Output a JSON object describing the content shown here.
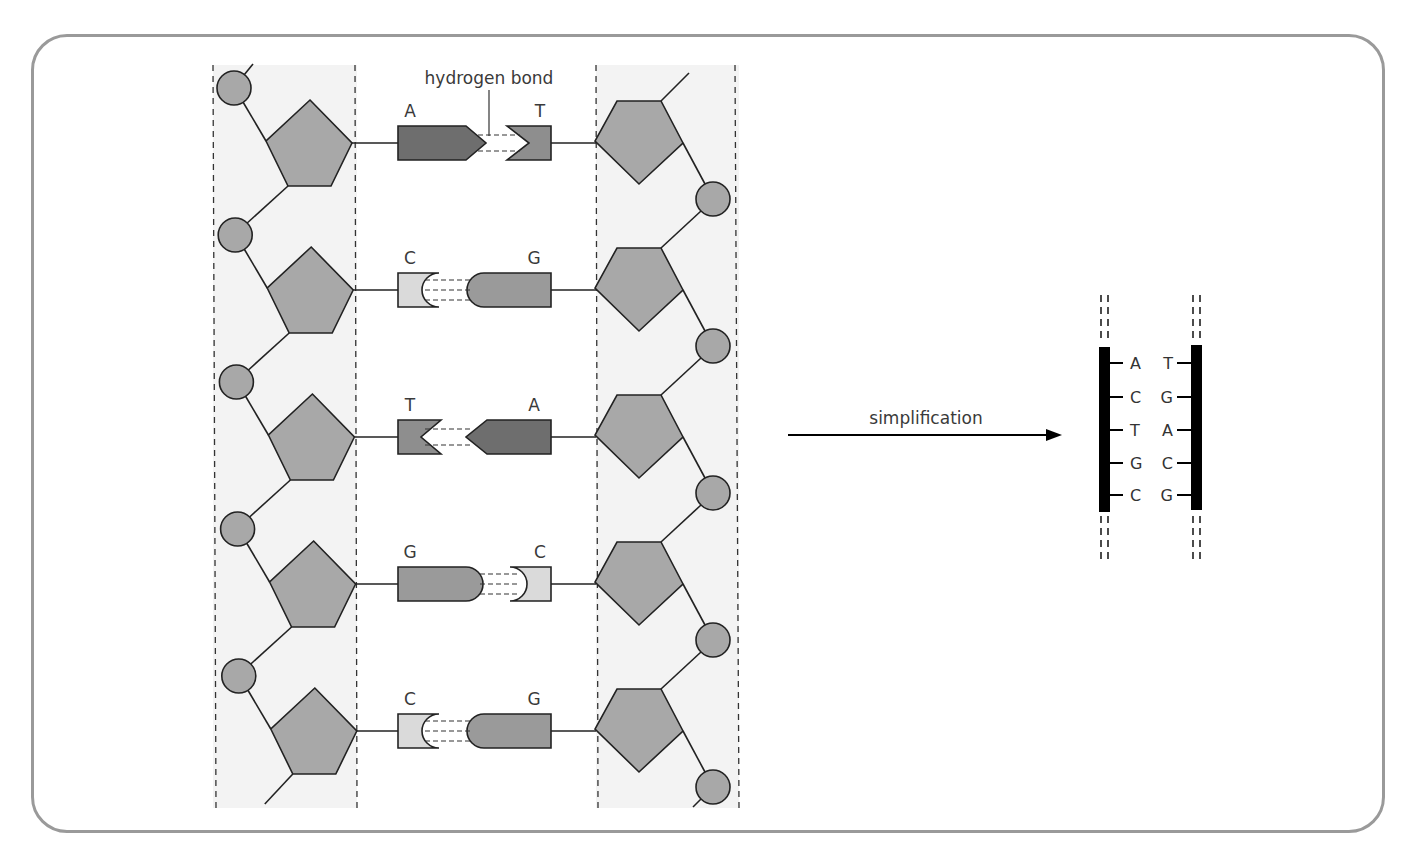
{
  "colors": {
    "frame": "#9a9a9a",
    "band": "#f3f3f3",
    "sugar": "#a8a8a8",
    "phosphate": "#a8a8a8",
    "A": "#6e6e6e",
    "T": "#8e8e8e",
    "G": "#9a9a9a",
    "C": "#dadada",
    "strand": "#000000"
  },
  "labels": {
    "hydrogen_bond": "hydrogen bond",
    "arrow": "simplification"
  },
  "base_pairs": [
    {
      "left": "A",
      "right": "T"
    },
    {
      "left": "C",
      "right": "G"
    },
    {
      "left": "T",
      "right": "A"
    },
    {
      "left": "G",
      "right": "C"
    },
    {
      "left": "C",
      "right": "G"
    }
  ],
  "simplified": {
    "left": [
      "A",
      "C",
      "T",
      "G",
      "C"
    ],
    "right": [
      "T",
      "G",
      "A",
      "C",
      "G"
    ]
  }
}
